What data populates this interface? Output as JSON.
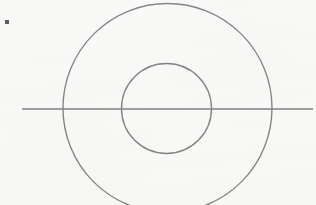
{
  "figure": {
    "title": "Concentric circles with horizontal diameter line",
    "type": "line-drawing",
    "canvas": {
      "width": 316,
      "height": 205,
      "background_color": "#f8f8f6"
    },
    "stroke_color": "#6d6d72",
    "marker_color": "#3a3a3c",
    "shapes": [
      {
        "name": "outer-circle",
        "kind": "circle",
        "center_x": 167.5,
        "center_y": 108,
        "radius": 104.5,
        "stroke_width": 1.35,
        "clipped_at_bottom": true
      },
      {
        "name": "inner-circle",
        "kind": "circle",
        "center_x": 166.5,
        "center_y": 108.5,
        "radius": 45,
        "stroke_width": 1.35,
        "clipped_at_bottom": false
      },
      {
        "name": "horizontal-axis-line",
        "kind": "line",
        "x1": 22,
        "y1": 109,
        "x2": 313,
        "y2": 109,
        "stroke_width": 1.6
      },
      {
        "name": "corner-marker",
        "kind": "square",
        "x": 5,
        "y": 20,
        "size": 4,
        "fill": "#3a3a3c"
      }
    ]
  }
}
